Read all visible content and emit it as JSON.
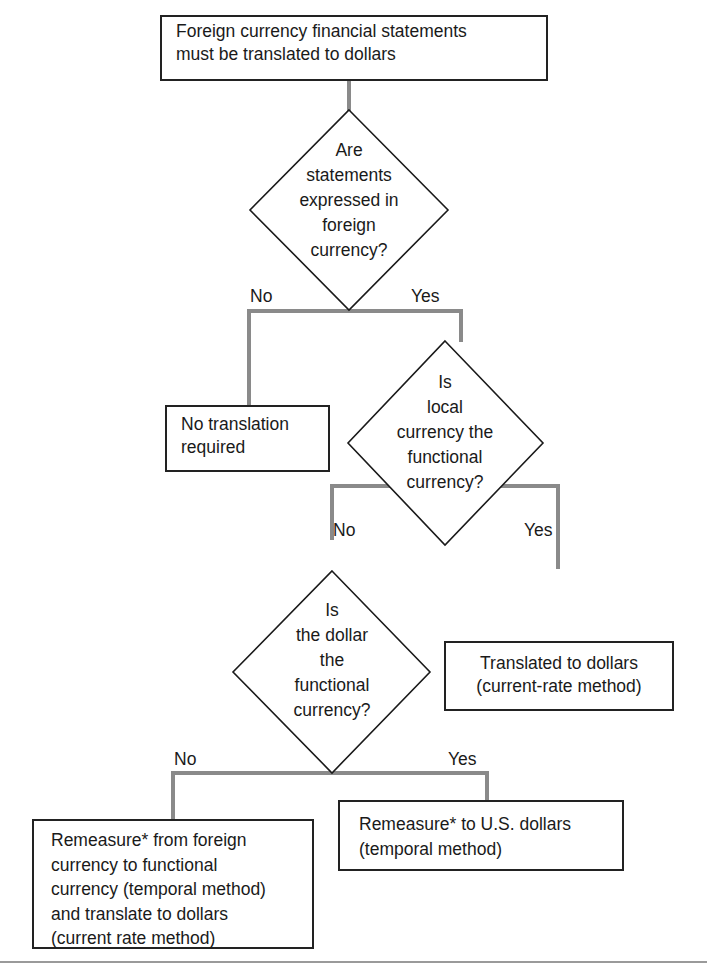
{
  "diagram": {
    "type": "flowchart",
    "colors": {
      "box_border": "#222222",
      "connector": "#8a8a8a",
      "text": "#1a1a1a",
      "background": "#ffffff"
    },
    "start": {
      "lines": [
        "Foreign currency financial statements",
        "must be translated to dollars"
      ]
    },
    "decision1": {
      "lines": [
        "Are",
        "statements",
        "expressed in",
        "foreign",
        "currency?"
      ],
      "no_label": "No",
      "yes_label": "Yes"
    },
    "outcome_no_translation": {
      "lines": [
        "No translation",
        "required"
      ]
    },
    "decision2": {
      "lines": [
        "Is",
        "local",
        "currency the",
        "functional",
        "currency?"
      ],
      "no_label": "No",
      "yes_label": "Yes"
    },
    "outcome_current_rate": {
      "lines": [
        "Translated to dollars",
        "(current-rate method)"
      ]
    },
    "decision3": {
      "lines": [
        "Is",
        "the dollar",
        "the",
        "functional",
        "currency?"
      ],
      "no_label": "No",
      "yes_label": "Yes"
    },
    "outcome_remeasure_and_translate": {
      "lines": [
        "Remeasure* from foreign",
        "currency to functional",
        "currency (temporal method)",
        "and translate to dollars",
        "(current rate method)"
      ]
    },
    "outcome_remeasure_usd": {
      "lines": [
        "Remeasure* to U.S. dollars",
        "(temporal method)"
      ]
    }
  }
}
